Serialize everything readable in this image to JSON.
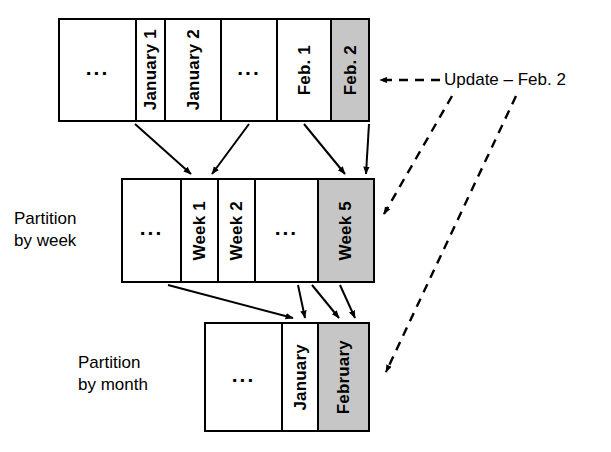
{
  "diagram": {
    "colors": {
      "shaded_cell": "#c6c6c6",
      "cell_background": "#ffffff",
      "stroke": "#000000"
    },
    "rows": [
      {
        "id": "row-day",
        "caption": "",
        "cells": [
          {
            "label": "...",
            "kind": "ellipsis",
            "shaded": false
          },
          {
            "label": "January 1",
            "kind": "text",
            "shaded": false
          },
          {
            "label": "January 2",
            "kind": "text",
            "shaded": false
          },
          {
            "label": "...",
            "kind": "ellipsis",
            "shaded": false
          },
          {
            "label": "Feb. 1",
            "kind": "text",
            "shaded": false
          },
          {
            "label": "Feb. 2",
            "kind": "text",
            "shaded": true
          }
        ]
      },
      {
        "id": "row-week",
        "caption": "Partition\nby week",
        "cells": [
          {
            "label": "...",
            "kind": "ellipsis",
            "shaded": false
          },
          {
            "label": "Week 1",
            "kind": "text",
            "shaded": false
          },
          {
            "label": "Week 2",
            "kind": "text",
            "shaded": false
          },
          {
            "label": "...",
            "kind": "ellipsis",
            "shaded": false
          },
          {
            "label": "Week 5",
            "kind": "text",
            "shaded": true
          }
        ]
      },
      {
        "id": "row-month",
        "caption": "Partition\nby month",
        "cells": [
          {
            "label": "...",
            "kind": "ellipsis",
            "shaded": false
          },
          {
            "label": "January",
            "kind": "text",
            "shaded": false
          },
          {
            "label": "February",
            "kind": "text",
            "shaded": true
          }
        ]
      }
    ],
    "annotation": {
      "update_label": "Update – Feb. 2"
    }
  }
}
